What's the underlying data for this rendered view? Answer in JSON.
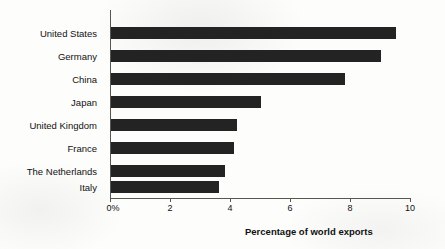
{
  "chart_data": {
    "type": "bar",
    "orientation": "horizontal",
    "title": "",
    "xlabel": "Percentage of world exports",
    "ylabel": "",
    "categories": [
      "United States",
      "Germany",
      "China",
      "Japan",
      "United Kingdom",
      "France",
      "The Netherlands",
      "Italy"
    ],
    "values": [
      9.5,
      9.0,
      7.8,
      5.0,
      4.2,
      4.1,
      3.8,
      3.6
    ],
    "xlim": [
      0,
      10
    ],
    "xticks": [
      0,
      2,
      4,
      6,
      8,
      10
    ],
    "xtick_labels": [
      "0%",
      "2",
      "4",
      "6",
      "8",
      "10"
    ],
    "grid": false,
    "legend": false,
    "bar_color": "#232323",
    "axis_color": "#555753",
    "background_color": "#fdfdfc"
  }
}
